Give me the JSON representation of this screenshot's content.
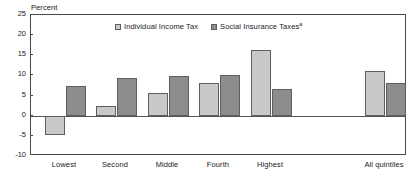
{
  "chart_data": {
    "type": "bar",
    "title": "",
    "subtitle": "",
    "xlabel": "",
    "ylabel": "Percent",
    "ylim": [
      -10,
      25
    ],
    "ytick_values": [
      25,
      20,
      15,
      10,
      5,
      0,
      -5,
      -10
    ],
    "ytick_labels": [
      "25",
      "20",
      "15",
      "10",
      "5",
      "0",
      "-5",
      "-10"
    ],
    "grid": false,
    "legend_position": "top-center",
    "categories": [
      "Lowest",
      "Second",
      "Middle",
      "Fourth",
      "Highest",
      "All quintiles"
    ],
    "series": [
      {
        "name": "Individual Income Tax",
        "color": "#c9c9c9",
        "values": [
          -4.8,
          2.5,
          5.7,
          8.2,
          16.3,
          11.0
        ]
      },
      {
        "name": "Social Insurance Taxes",
        "footnote_marker": "a",
        "color": "#8d8d8d",
        "values": [
          7.3,
          9.3,
          9.8,
          10.2,
          6.6,
          8.2
        ]
      }
    ],
    "annotations": []
  },
  "axis": {
    "y_title": "Percent"
  },
  "legend": {
    "items": [
      {
        "label": "Individual Income Tax",
        "marker": ""
      },
      {
        "label": "Social Insurance Taxes",
        "marker": "a"
      }
    ]
  }
}
